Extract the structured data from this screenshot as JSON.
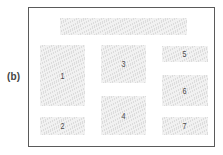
{
  "figure_label": "(b)",
  "colors": {
    "frame_border": "#5a5a5a",
    "block_fill": "#f1f1f1",
    "block_hatch": "#dcdcdc",
    "text": "#444444"
  },
  "blocks": [
    {
      "id": "header",
      "label": "",
      "x": 60,
      "y": 18,
      "w": 127,
      "h": 17
    },
    {
      "id": "1",
      "label": "1",
      "x": 40,
      "y": 45,
      "w": 45,
      "h": 61
    },
    {
      "id": "2",
      "label": "2",
      "x": 40,
      "y": 117,
      "w": 45,
      "h": 18
    },
    {
      "id": "3",
      "label": "3",
      "x": 101,
      "y": 45,
      "w": 45,
      "h": 38
    },
    {
      "id": "4",
      "label": "4",
      "x": 101,
      "y": 96,
      "w": 45,
      "h": 39
    },
    {
      "id": "5",
      "label": "5",
      "x": 162,
      "y": 46,
      "w": 46,
      "h": 16
    },
    {
      "id": "6",
      "label": "6",
      "x": 162,
      "y": 75,
      "w": 46,
      "h": 31
    },
    {
      "id": "7",
      "label": "7",
      "x": 162,
      "y": 117,
      "w": 46,
      "h": 18
    }
  ]
}
